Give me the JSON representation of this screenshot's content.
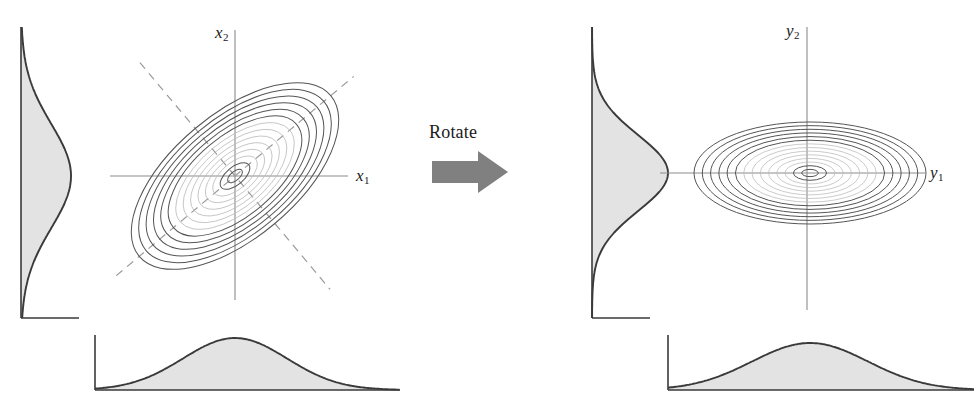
{
  "figure": {
    "title": "",
    "transform_label": "Rotate",
    "transform_icon": "right-arrow-icon",
    "background_color": "#ffffff",
    "stroke_color": "#3a3a3a",
    "contour_color": "#555555",
    "faint_contour_color": "#b9b9b9",
    "dashed_color": "#9a9a9a",
    "fill_color": "#e3e3e3",
    "arrow_color": "#808080"
  },
  "left_panel": {
    "name": "correlated-gaussian-panel",
    "x_axis_label": "x",
    "x_axis_subscript": "1",
    "y_axis_label": "x",
    "y_axis_subscript": "2",
    "contour_type": "tilted-ellipses",
    "tilt_degrees": 40,
    "principal_axes": "dashed"
  },
  "right_panel": {
    "name": "decorrelated-gaussian-panel",
    "x_axis_label": "y",
    "x_axis_subscript": "1",
    "y_axis_label": "y",
    "y_axis_subscript": "2",
    "contour_type": "axis-aligned-ellipses",
    "tilt_degrees": 0,
    "principal_axes": "none"
  },
  "chart_data": {
    "type": "contour",
    "xlabel": "",
    "ylabel": "",
    "grid": false,
    "legend": "none",
    "panels": [
      {
        "name": "left",
        "axis_labels": {
          "x": "x1",
          "y": "x2"
        },
        "center": [
          235,
          176
        ],
        "ellipse_tilt_deg": -40,
        "contour_levels": [
          1,
          2,
          3,
          4,
          5,
          6,
          7,
          8,
          9,
          10,
          11,
          12,
          13,
          14
        ],
        "semi_major_outer": 125,
        "semi_minor_outer": 62,
        "dashed_principal_axes": true,
        "marginal_bottom": {
          "type": "gaussian",
          "mean_px": 235,
          "sigma_px": 52,
          "peak_height_px": 52,
          "baseline_y_px": 390,
          "axis_x_px": 95,
          "domain_px": [
            95,
            400
          ]
        },
        "marginal_left": {
          "type": "gaussian",
          "mean_px": 176,
          "sigma_px": 52,
          "peak_width_px": 50,
          "axis_x_px": 21,
          "domain_px": [
            27,
            318
          ]
        }
      },
      {
        "name": "right",
        "axis_labels": {
          "x": "y1",
          "y": "y2"
        },
        "center": [
          810,
          173
        ],
        "ellipse_tilt_deg": 0,
        "contour_levels": [
          1,
          2,
          3,
          4,
          5,
          6,
          7,
          8,
          9,
          10,
          11,
          12,
          13,
          14
        ],
        "semi_major_outer": 116,
        "semi_minor_outer": 51,
        "dashed_principal_axes": false,
        "marginal_bottom": {
          "type": "gaussian",
          "mean_px": 810,
          "sigma_px": 58,
          "peak_height_px": 47,
          "baseline_y_px": 390,
          "axis_x_px": 668,
          "domain_px": [
            668,
            974
          ]
        },
        "marginal_left": {
          "type": "gaussian",
          "mean_px": 173,
          "sigma_px": 38,
          "peak_width_px": 76,
          "axis_x_px": 592,
          "domain_px": [
            27,
            318
          ]
        }
      }
    ]
  }
}
